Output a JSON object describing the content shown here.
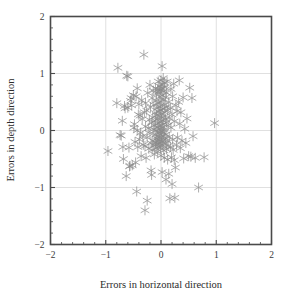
{
  "chart_data": {
    "type": "scatter",
    "title": "",
    "xlabel": "Errors in horizontal direction",
    "ylabel": "Errors in depth direction",
    "xlim": [
      -2,
      2
    ],
    "ylim": [
      -2,
      2
    ],
    "xticks": [
      -2,
      -1,
      0,
      1,
      2
    ],
    "yticks": [
      -2,
      -1,
      0,
      1,
      2
    ],
    "xtick_labels": [
      "−2",
      "−1",
      "0",
      "1",
      "2"
    ],
    "ytick_labels": [
      "−2",
      "−1",
      "0",
      "1",
      "2"
    ],
    "minor_ticks_per_interval": 5,
    "grid": true,
    "grid_values_x": [
      -1,
      0,
      1
    ],
    "grid_values_y": [
      -1,
      0,
      1
    ],
    "legend": null,
    "marker": "asterisk",
    "marker_color": "#8a8a8a",
    "marker_size": 4.6,
    "frame_color": "#4a4a4a",
    "grid_color": "#d8d8d8",
    "background": "#ffffff",
    "n_points": 162,
    "points": [
      [
        -0.96,
        -0.36
      ],
      [
        -0.78,
        1.1
      ],
      [
        -0.74,
        -0.08
      ],
      [
        -0.72,
        -0.09
      ],
      [
        -0.7,
        0.17
      ],
      [
        -0.69,
        -0.29
      ],
      [
        -0.68,
        -0.5
      ],
      [
        -0.66,
        0.43
      ],
      [
        -0.65,
        0.39
      ],
      [
        -0.63,
        -0.8
      ],
      [
        -0.62,
        0.96
      ],
      [
        -0.6,
        0.95
      ],
      [
        -0.6,
        0.4
      ],
      [
        -0.58,
        -0.3
      ],
      [
        -0.57,
        -0.63
      ],
      [
        -0.56,
        -0.62
      ],
      [
        -0.55,
        0.52
      ],
      [
        -0.54,
        0.57
      ],
      [
        -0.53,
        0.44
      ],
      [
        -0.52,
        -0.61
      ],
      [
        -0.5,
        0.62
      ],
      [
        -0.49,
        0.05
      ],
      [
        -0.48,
        0.11
      ],
      [
        -0.47,
        -0.2
      ],
      [
        -0.46,
        -0.56
      ],
      [
        -0.45,
        0.6
      ],
      [
        -0.44,
        -1.07
      ],
      [
        -0.43,
        0.0
      ],
      [
        -0.42,
        -0.29
      ],
      [
        -0.41,
        0.28
      ],
      [
        -0.4,
        0.46
      ],
      [
        -0.39,
        -0.16
      ],
      [
        -0.38,
        0.26
      ],
      [
        -0.37,
        -0.04
      ],
      [
        -0.36,
        -0.45
      ],
      [
        -0.35,
        0.53
      ],
      [
        -0.34,
        0.2
      ],
      [
        -0.33,
        -0.1
      ],
      [
        -0.32,
        -0.25
      ],
      [
        -0.31,
        1.33
      ],
      [
        -0.3,
        0.32
      ],
      [
        -0.29,
        -0.27
      ],
      [
        -0.28,
        0.48
      ],
      [
        -0.28,
        0.07
      ],
      [
        -0.27,
        -0.48
      ],
      [
        -0.26,
        0.35
      ],
      [
        -0.25,
        -0.12
      ],
      [
        -0.25,
        -1.23
      ],
      [
        -0.24,
        0.66
      ],
      [
        -0.23,
        0.04
      ],
      [
        -0.22,
        -0.32
      ],
      [
        -0.21,
        0.19
      ],
      [
        -0.2,
        0.8
      ],
      [
        -0.2,
        -0.05
      ],
      [
        -0.19,
        0.41
      ],
      [
        -0.18,
        -0.22
      ],
      [
        -0.18,
        -0.7
      ],
      [
        -0.17,
        0.14
      ],
      [
        -0.16,
        0.57
      ],
      [
        -0.16,
        -0.34
      ],
      [
        -0.15,
        0.23
      ],
      [
        -0.15,
        -0.18
      ],
      [
        -0.14,
        0.7
      ],
      [
        -0.14,
        0.02
      ],
      [
        -0.13,
        -0.26
      ],
      [
        -0.13,
        0.45
      ],
      [
        -0.12,
        0.09
      ],
      [
        -0.12,
        -0.42
      ],
      [
        -0.11,
        0.31
      ],
      [
        -0.11,
        -0.08
      ],
      [
        -0.1,
        0.74
      ],
      [
        -0.1,
        0.17
      ],
      [
        -0.1,
        -0.21
      ],
      [
        -0.09,
        0.52
      ],
      [
        -0.09,
        0.0
      ],
      [
        -0.09,
        -0.31
      ],
      [
        -0.08,
        0.64
      ],
      [
        -0.08,
        0.27
      ],
      [
        -0.08,
        -0.14
      ],
      [
        -0.07,
        0.39
      ],
      [
        -0.07,
        0.05
      ],
      [
        -0.07,
        -0.24
      ],
      [
        -0.06,
        0.72
      ],
      [
        -0.06,
        0.21
      ],
      [
        -0.06,
        -0.1
      ],
      [
        -0.06,
        -0.37
      ],
      [
        -0.05,
        0.86
      ],
      [
        -0.05,
        0.48
      ],
      [
        -0.05,
        0.12
      ],
      [
        -0.05,
        -0.19
      ],
      [
        -0.04,
        0.68
      ],
      [
        -0.04,
        0.33
      ],
      [
        -0.04,
        -0.02
      ],
      [
        -0.04,
        -0.28
      ],
      [
        -0.03,
        0.78
      ],
      [
        -0.03,
        0.42
      ],
      [
        -0.03,
        0.08
      ],
      [
        -0.03,
        -0.16
      ],
      [
        -0.02,
        0.59
      ],
      [
        -0.02,
        0.25
      ],
      [
        -0.02,
        -0.06
      ],
      [
        -0.02,
        -0.23
      ],
      [
        -0.01,
        0.71
      ],
      [
        -0.01,
        0.36
      ],
      [
        -0.01,
        0.03
      ],
      [
        -0.01,
        -0.3
      ],
      [
        0.0,
        0.88
      ],
      [
        0.0,
        0.5
      ],
      [
        0.0,
        0.15
      ],
      [
        0.0,
        -0.12
      ],
      [
        0.0,
        -0.44
      ],
      [
        0.01,
        0.74
      ],
      [
        0.01,
        0.29
      ],
      [
        0.01,
        -0.01
      ],
      [
        0.01,
        -0.2
      ],
      [
        0.02,
        1.13
      ],
      [
        0.02,
        0.62
      ],
      [
        0.02,
        0.18
      ],
      [
        0.02,
        -0.09
      ],
      [
        0.02,
        -0.73
      ],
      [
        0.03,
        0.8
      ],
      [
        0.03,
        0.38
      ],
      [
        0.03,
        0.06
      ],
      [
        0.03,
        -0.26
      ],
      [
        0.04,
        0.92
      ],
      [
        0.04,
        0.54
      ],
      [
        0.04,
        0.11
      ],
      [
        0.04,
        -0.17
      ],
      [
        0.05,
        0.69
      ],
      [
        0.05,
        0.24
      ],
      [
        0.05,
        -0.04
      ],
      [
        0.05,
        -0.35
      ],
      [
        0.06,
        0.84
      ],
      [
        0.06,
        0.44
      ],
      [
        0.06,
        0.01
      ],
      [
        0.06,
        -0.48
      ],
      [
        0.07,
        0.76
      ],
      [
        0.07,
        0.32
      ],
      [
        0.07,
        -0.13
      ],
      [
        0.08,
        0.58
      ],
      [
        0.08,
        0.2
      ],
      [
        0.08,
        -0.22
      ],
      [
        0.09,
        0.41
      ],
      [
        0.09,
        -0.07
      ],
      [
        0.09,
        -0.86
      ],
      [
        0.1,
        0.66
      ],
      [
        0.1,
        0.14
      ],
      [
        0.1,
        -0.33
      ],
      [
        0.11,
        0.86
      ],
      [
        0.11,
        -0.18
      ],
      [
        0.12,
        0.35
      ],
      [
        0.12,
        -0.51
      ],
      [
        0.13,
        0.09
      ],
      [
        0.13,
        -0.27
      ],
      [
        0.14,
        0.5
      ],
      [
        0.14,
        -0.76
      ],
      [
        0.15,
        0.22
      ],
      [
        0.15,
        -0.11
      ],
      [
        0.16,
        -1.19
      ],
      [
        0.17,
        0.4
      ],
      [
        0.17,
        -0.29
      ],
      [
        0.18,
        0.73
      ],
      [
        0.18,
        0.05
      ],
      [
        0.19,
        -0.47
      ],
      [
        0.2,
        0.28
      ],
      [
        0.2,
        -0.94
      ],
      [
        0.21,
        0.6
      ],
      [
        0.21,
        -0.16
      ],
      [
        0.22,
        -0.34
      ],
      [
        0.23,
        0.82
      ],
      [
        0.24,
        0.16
      ],
      [
        0.25,
        -1.18
      ],
      [
        0.26,
        -0.65
      ],
      [
        0.27,
        0.44
      ],
      [
        0.28,
        -0.25
      ],
      [
        0.29,
        0.34
      ],
      [
        0.3,
        -0.12
      ],
      [
        0.32,
        0.5
      ],
      [
        0.33,
        0.88
      ],
      [
        0.34,
        0.12
      ],
      [
        0.35,
        -0.31
      ],
      [
        0.36,
        0.32
      ],
      [
        0.38,
        -0.18
      ],
      [
        0.4,
        0.58
      ],
      [
        0.41,
        -0.49
      ],
      [
        0.43,
        0.03
      ],
      [
        0.45,
        -0.22
      ],
      [
        0.47,
        0.21
      ],
      [
        0.5,
        -0.45
      ],
      [
        0.52,
        0.75
      ],
      [
        0.54,
        -0.46
      ],
      [
        0.56,
        0.57
      ],
      [
        0.58,
        -0.1
      ],
      [
        0.62,
        -0.48
      ],
      [
        0.68,
        -1.0
      ],
      [
        0.78,
        -0.47
      ],
      [
        0.97,
        0.13
      ],
      [
        -0.8,
        0.48
      ],
      [
        -0.43,
        0.74
      ],
      [
        -0.17,
        -0.78
      ],
      [
        0.24,
        -0.52
      ],
      [
        -0.29,
        -1.4
      ]
    ]
  }
}
